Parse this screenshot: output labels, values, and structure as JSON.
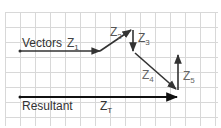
{
  "diagram": {
    "labels": {
      "vectors": "Vectors",
      "z1": "Z",
      "z1_sub": "1",
      "z2": "Z",
      "z2_sub": "2",
      "z3": "Z",
      "z3_sub": "3",
      "z4": "Z",
      "z4_sub": "4",
      "z5": "Z",
      "z5_sub": "5",
      "resultant": "Resultant",
      "zt": "Z",
      "zt_sub": "T"
    },
    "colors": {
      "grid": "#d8d8d8",
      "vector": "#333333",
      "resultant": "#111111",
      "label": "#555555"
    }
  }
}
